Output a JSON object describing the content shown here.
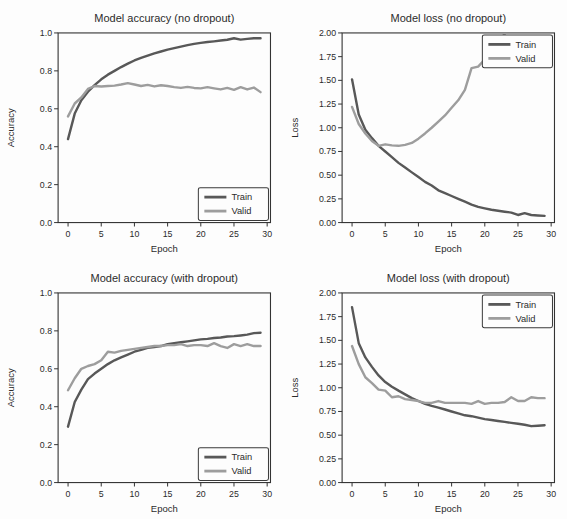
{
  "figure": {
    "background": "#fdfdfd",
    "colors": {
      "train": "#585858",
      "valid": "#9d9d9d",
      "axis": "#333333",
      "text": "#2b2b2b",
      "legend_border": "#3a3a3a",
      "legend_bg": "#fdfdfd"
    }
  },
  "chart_data": [
    {
      "type": "line",
      "title": "Model accuracy (no dropout)",
      "xlabel": "Epoch",
      "ylabel": "Accuracy",
      "xlim": [
        -1.5,
        30.5
      ],
      "ylim": [
        0.0,
        1.0
      ],
      "xticks": [
        0,
        5,
        10,
        15,
        20,
        25,
        30
      ],
      "xtick_labels": [
        "0",
        "5",
        "10",
        "15",
        "20",
        "25",
        "30"
      ],
      "yticks": [
        0.0,
        0.2,
        0.4,
        0.6,
        0.8,
        1.0
      ],
      "ytick_labels": [
        "0.0",
        "0.2",
        "0.4",
        "0.6",
        "0.8",
        "1.0"
      ],
      "grid": false,
      "legend": {
        "position": "lower-right",
        "labels": [
          "Train",
          "Valid"
        ]
      },
      "x_note": "x value = epoch index starting at 0",
      "series": [
        {
          "name": "Train",
          "color_key": "train",
          "values": [
            0.44,
            0.575,
            0.645,
            0.69,
            0.725,
            0.755,
            0.78,
            0.8,
            0.82,
            0.838,
            0.855,
            0.868,
            0.88,
            0.892,
            0.902,
            0.912,
            0.92,
            0.928,
            0.936,
            0.942,
            0.948,
            0.952,
            0.956,
            0.96,
            0.964,
            0.972,
            0.965,
            0.969,
            0.972,
            0.972
          ]
        },
        {
          "name": "Valid",
          "color_key": "valid",
          "values": [
            0.56,
            0.628,
            0.66,
            0.705,
            0.72,
            0.718,
            0.72,
            0.722,
            0.728,
            0.735,
            0.728,
            0.72,
            0.726,
            0.718,
            0.724,
            0.72,
            0.714,
            0.71,
            0.716,
            0.71,
            0.708,
            0.714,
            0.708,
            0.702,
            0.71,
            0.7,
            0.714,
            0.702,
            0.712,
            0.688
          ]
        }
      ]
    },
    {
      "type": "line",
      "title": "Model loss (no dropout)",
      "xlabel": "Epoch",
      "ylabel": "Loss",
      "xlim": [
        -1.5,
        30.5
      ],
      "ylim": [
        0.0,
        2.0
      ],
      "xticks": [
        0,
        5,
        10,
        15,
        20,
        25,
        30
      ],
      "xtick_labels": [
        "0",
        "5",
        "10",
        "15",
        "20",
        "25",
        "30"
      ],
      "yticks": [
        0.0,
        0.25,
        0.5,
        0.75,
        1.0,
        1.25,
        1.5,
        1.75,
        2.0
      ],
      "ytick_labels": [
        "0.00",
        "0.25",
        "0.50",
        "0.75",
        "1.00",
        "1.25",
        "1.50",
        "1.75",
        "2.00"
      ],
      "grid": false,
      "legend": {
        "position": "upper-right",
        "labels": [
          "Train",
          "Valid"
        ]
      },
      "x_note": "x value = epoch index starting at 0; Valid curve exits above y-axis max near epoch 24",
      "series": [
        {
          "name": "Train",
          "color_key": "train",
          "values": [
            1.51,
            1.14,
            0.98,
            0.89,
            0.81,
            0.75,
            0.69,
            0.63,
            0.58,
            0.53,
            0.48,
            0.43,
            0.39,
            0.34,
            0.31,
            0.28,
            0.25,
            0.22,
            0.19,
            0.165,
            0.15,
            0.135,
            0.125,
            0.115,
            0.105,
            0.08,
            0.1,
            0.08,
            0.075,
            0.07
          ]
        },
        {
          "name": "Valid",
          "color_key": "valid",
          "values": [
            1.22,
            1.04,
            0.94,
            0.86,
            0.81,
            0.825,
            0.815,
            0.81,
            0.82,
            0.84,
            0.885,
            0.94,
            1.0,
            1.065,
            1.13,
            1.21,
            1.29,
            1.4,
            1.63,
            1.645,
            1.72,
            1.81,
            1.91,
            1.99,
            2.08
          ]
        }
      ]
    },
    {
      "type": "line",
      "title": "Model accuracy (with dropout)",
      "xlabel": "Epoch",
      "ylabel": "Accuracy",
      "xlim": [
        -1.5,
        30.5
      ],
      "ylim": [
        0.0,
        1.0
      ],
      "xticks": [
        0,
        5,
        10,
        15,
        20,
        25,
        30
      ],
      "xtick_labels": [
        "0",
        "5",
        "10",
        "15",
        "20",
        "25",
        "30"
      ],
      "yticks": [
        0.0,
        0.2,
        0.4,
        0.6,
        0.8,
        1.0
      ],
      "ytick_labels": [
        "0.0",
        "0.2",
        "0.4",
        "0.6",
        "0.8",
        "1.0"
      ],
      "grid": false,
      "legend": {
        "position": "lower-right",
        "labels": [
          "Train",
          "Valid"
        ]
      },
      "x_note": "x value = epoch index starting at 0",
      "series": [
        {
          "name": "Train",
          "color_key": "train",
          "values": [
            0.295,
            0.425,
            0.49,
            0.545,
            0.575,
            0.6,
            0.625,
            0.645,
            0.66,
            0.675,
            0.69,
            0.7,
            0.71,
            0.715,
            0.72,
            0.73,
            0.735,
            0.74,
            0.745,
            0.75,
            0.755,
            0.758,
            0.762,
            0.765,
            0.77,
            0.772,
            0.776,
            0.78,
            0.788,
            0.79
          ]
        },
        {
          "name": "Valid",
          "color_key": "valid",
          "values": [
            0.487,
            0.55,
            0.6,
            0.615,
            0.625,
            0.645,
            0.69,
            0.685,
            0.695,
            0.7,
            0.705,
            0.71,
            0.715,
            0.72,
            0.72,
            0.725,
            0.725,
            0.73,
            0.72,
            0.725,
            0.725,
            0.72,
            0.735,
            0.72,
            0.71,
            0.73,
            0.72,
            0.73,
            0.72,
            0.72
          ]
        }
      ]
    },
    {
      "type": "line",
      "title": "Model loss (with dropout)",
      "xlabel": "Epoch",
      "ylabel": "Loss",
      "xlim": [
        -1.5,
        30.5
      ],
      "ylim": [
        0.0,
        2.0
      ],
      "xticks": [
        0,
        5,
        10,
        15,
        20,
        25,
        30
      ],
      "xtick_labels": [
        "0",
        "5",
        "10",
        "15",
        "20",
        "25",
        "30"
      ],
      "yticks": [
        0.0,
        0.25,
        0.5,
        0.75,
        1.0,
        1.25,
        1.5,
        1.75,
        2.0
      ],
      "ytick_labels": [
        "0.00",
        "0.25",
        "0.50",
        "0.75",
        "1.00",
        "1.25",
        "1.50",
        "1.75",
        "2.00"
      ],
      "grid": false,
      "legend": {
        "position": "upper-right",
        "labels": [
          "Train",
          "Valid"
        ]
      },
      "x_note": "x value = epoch index starting at 0",
      "series": [
        {
          "name": "Train",
          "color_key": "train",
          "values": [
            1.85,
            1.47,
            1.32,
            1.22,
            1.13,
            1.06,
            1.01,
            0.97,
            0.93,
            0.89,
            0.86,
            0.83,
            0.81,
            0.79,
            0.77,
            0.75,
            0.73,
            0.71,
            0.7,
            0.685,
            0.67,
            0.66,
            0.65,
            0.64,
            0.63,
            0.62,
            0.61,
            0.595,
            0.6,
            0.605
          ]
        },
        {
          "name": "Valid",
          "color_key": "valid",
          "values": [
            1.44,
            1.25,
            1.11,
            1.05,
            0.98,
            0.97,
            0.9,
            0.91,
            0.88,
            0.87,
            0.86,
            0.84,
            0.84,
            0.86,
            0.84,
            0.84,
            0.84,
            0.84,
            0.83,
            0.86,
            0.83,
            0.84,
            0.84,
            0.85,
            0.9,
            0.86,
            0.86,
            0.9,
            0.89,
            0.89
          ]
        }
      ]
    }
  ]
}
